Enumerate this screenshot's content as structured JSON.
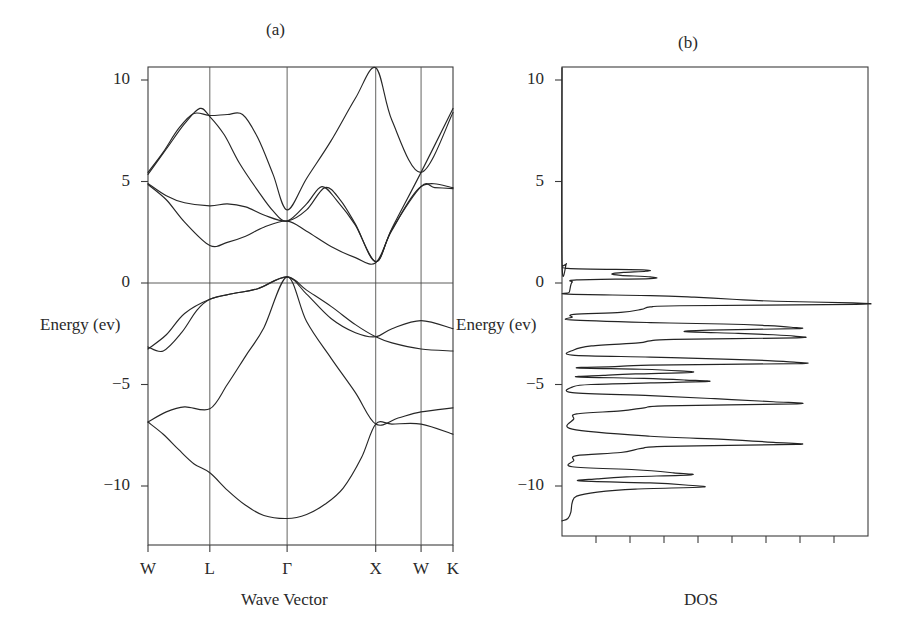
{
  "figure": {
    "panel_a": {
      "title": "(a)",
      "xlabel": "Wave Vector",
      "ylabel": "Energy (ev)"
    },
    "panel_b": {
      "title": "(b)",
      "xlabel": "DOS",
      "ylabel": "Energy (ev)"
    }
  },
  "energy_ticks": [
    {
      "label": "10",
      "value": 10
    },
    {
      "label": "5",
      "value": 5
    },
    {
      "label": "0",
      "value": 0
    },
    {
      "label": "−5",
      "value": -5
    },
    {
      "label": "−10",
      "value": -10
    }
  ],
  "k_ticks": [
    {
      "label": "W",
      "pos": 0.0
    },
    {
      "label": "L",
      "pos": 0.2027
    },
    {
      "label": "Γ",
      "pos": 0.4561
    },
    {
      "label": "X",
      "pos": 0.7466
    },
    {
      "label": "W",
      "pos": 0.8953
    },
    {
      "label": "K",
      "pos": 1.0
    }
  ],
  "chart_data": [
    {
      "type": "line",
      "title": "(a)",
      "xlabel": "Wave Vector",
      "ylabel": "Energy (ev)",
      "ylim": [
        -11.8,
        10.8
      ],
      "grid": true,
      "legend": "none",
      "x_tick_labels": [
        "W",
        "L",
        "Γ",
        "X",
        "W",
        "K"
      ],
      "x_tick_positions": [
        0.0,
        0.2027,
        0.4561,
        0.7466,
        0.8953,
        1.0
      ],
      "y_tick_labels": [
        "10",
        "5",
        "0",
        "−5",
        "−10"
      ],
      "y_tick_values": [
        10,
        5,
        0,
        -5,
        -10
      ],
      "series": [
        {
          "name": "valence-band-1",
          "comment": "lowest valence band, min at Gamma -11.6",
          "points": [
            [
              0.0,
              -6.85
            ],
            [
              0.05,
              -7.45
            ],
            [
              0.1,
              -8.2
            ],
            [
              0.15,
              -8.9
            ],
            [
              0.2027,
              -9.35
            ],
            [
              0.26,
              -10.2
            ],
            [
              0.32,
              -10.95
            ],
            [
              0.38,
              -11.45
            ],
            [
              0.4561,
              -11.6
            ],
            [
              0.52,
              -11.4
            ],
            [
              0.58,
              -10.9
            ],
            [
              0.64,
              -10.1
            ],
            [
              0.7,
              -8.6
            ],
            [
              0.7466,
              -6.95
            ],
            [
              0.8,
              -6.95
            ],
            [
              0.8953,
              -6.95
            ],
            [
              1.0,
              -7.45
            ]
          ]
        },
        {
          "name": "valence-band-2",
          "comment": "second valence band W -6.85 to L -6.2, rises to Gamma 0.3",
          "points": [
            [
              0.0,
              -6.85
            ],
            [
              0.06,
              -6.35
            ],
            [
              0.12,
              -6.1
            ],
            [
              0.2027,
              -6.2
            ],
            [
              0.26,
              -5.0
            ],
            [
              0.32,
              -3.6
            ],
            [
              0.38,
              -2.2
            ],
            [
              0.4561,
              0.3
            ],
            [
              0.52,
              -1.9
            ],
            [
              0.6,
              -3.7
            ],
            [
              0.68,
              -5.4
            ],
            [
              0.7466,
              -6.95
            ],
            [
              0.82,
              -6.65
            ],
            [
              0.8953,
              -6.35
            ],
            [
              1.0,
              -6.15
            ]
          ]
        },
        {
          "name": "valence-band-3",
          "comment": "upper valence band W -3.15 rising to Gamma 0.3, down to X -2.65",
          "points": [
            [
              0.0,
              -3.15
            ],
            [
              0.05,
              -3.35
            ],
            [
              0.11,
              -2.45
            ],
            [
              0.16,
              -1.35
            ],
            [
              0.2027,
              -0.8
            ],
            [
              0.28,
              -0.52
            ],
            [
              0.36,
              -0.28
            ],
            [
              0.4561,
              0.3
            ],
            [
              0.52,
              -0.35
            ],
            [
              0.6,
              -1.15
            ],
            [
              0.68,
              -2.05
            ],
            [
              0.7466,
              -2.65
            ],
            [
              0.8,
              -2.95
            ],
            [
              0.8953,
              -3.25
            ],
            [
              1.0,
              -3.35
            ]
          ]
        },
        {
          "name": "valence-band-4",
          "comment": "degenerate top valence band W -3.25, Gamma 0.3, X -2.65 branch",
          "points": [
            [
              0.0,
              -3.25
            ],
            [
              0.06,
              -2.55
            ],
            [
              0.12,
              -1.5
            ],
            [
              0.2027,
              -0.8
            ],
            [
              0.28,
              -0.52
            ],
            [
              0.36,
              -0.28
            ],
            [
              0.4561,
              0.3
            ],
            [
              0.52,
              -0.55
            ],
            [
              0.6,
              -1.75
            ],
            [
              0.68,
              -2.45
            ],
            [
              0.7466,
              -2.65
            ],
            [
              0.8,
              -2.25
            ],
            [
              0.8953,
              -1.85
            ],
            [
              1.0,
              -2.25
            ]
          ]
        },
        {
          "name": "conduction-band-1",
          "comment": "lowest conduction band, X minimum 1.0, Gamma 3.6",
          "points": [
            [
              0.0,
              4.85
            ],
            [
              0.06,
              4.1
            ],
            [
              0.12,
              3.0
            ],
            [
              0.2027,
              1.85
            ],
            [
              0.26,
              2.0
            ],
            [
              0.32,
              2.3
            ],
            [
              0.38,
              2.75
            ],
            [
              0.4561,
              3.05
            ],
            [
              0.52,
              2.55
            ],
            [
              0.6,
              1.8
            ],
            [
              0.68,
              1.25
            ],
            [
              0.7466,
              1.0
            ],
            [
              0.8,
              2.6
            ],
            [
              0.8953,
              4.75
            ],
            [
              1.0,
              4.7
            ]
          ]
        },
        {
          "name": "conduction-band-2",
          "comment": "second conduction band, W 4.9 to L 3.8 flat, Gamma 3.6, rises to X 10.6",
          "points": [
            [
              0.0,
              4.9
            ],
            [
              0.06,
              4.3
            ],
            [
              0.12,
              3.95
            ],
            [
              0.2027,
              3.8
            ],
            [
              0.26,
              3.9
            ],
            [
              0.32,
              3.75
            ],
            [
              0.38,
              3.35
            ],
            [
              0.4561,
              3.05
            ],
            [
              0.52,
              3.6
            ],
            [
              0.58,
              4.7
            ],
            [
              0.63,
              4.1
            ],
            [
              0.68,
              2.9
            ],
            [
              0.7466,
              1.05
            ],
            [
              0.8,
              2.65
            ],
            [
              0.8953,
              4.75
            ],
            [
              0.94,
              4.7
            ],
            [
              1.0,
              4.65
            ]
          ]
        },
        {
          "name": "conduction-band-3",
          "comment": "W 5.45 to L 8.2, dips to Gamma 3.6, peak at X 10.6",
          "points": [
            [
              0.0,
              5.45
            ],
            [
              0.05,
              6.45
            ],
            [
              0.1,
              7.6
            ],
            [
              0.15,
              8.35
            ],
            [
              0.2027,
              8.25
            ],
            [
              0.26,
              8.3
            ],
            [
              0.31,
              8.3
            ],
            [
              0.36,
              7.15
            ],
            [
              0.41,
              5.35
            ],
            [
              0.4561,
              3.6
            ],
            [
              0.52,
              5.15
            ],
            [
              0.6,
              7.0
            ],
            [
              0.68,
              9.1
            ],
            [
              0.7466,
              10.6
            ],
            [
              0.8,
              8.0
            ],
            [
              0.8953,
              5.45
            ],
            [
              1.0,
              8.4
            ]
          ]
        },
        {
          "name": "conduction-band-4",
          "comment": "W 5.35 rising to L peak 8.6 then down, Gamma 4.85 branch",
          "points": [
            [
              0.0,
              5.35
            ],
            [
              0.06,
              6.6
            ],
            [
              0.12,
              7.85
            ],
            [
              0.17,
              8.6
            ],
            [
              0.2027,
              8.2
            ],
            [
              0.25,
              7.3
            ],
            [
              0.3,
              5.9
            ],
            [
              0.36,
              4.55
            ],
            [
              0.41,
              3.55
            ],
            [
              0.4561,
              3.05
            ],
            [
              0.52,
              3.9
            ],
            [
              0.57,
              4.75
            ],
            [
              0.62,
              4.05
            ],
            [
              0.68,
              2.85
            ],
            [
              0.7466,
              1.05
            ],
            [
              0.8,
              2.7
            ],
            [
              0.8953,
              5.45
            ],
            [
              1.0,
              8.6
            ]
          ]
        }
      ]
    },
    {
      "type": "line",
      "title": "(b)",
      "xlabel": "DOS",
      "ylabel": "Energy (ev)",
      "ylim": [
        -11.8,
        10.8
      ],
      "xlim": [
        0,
        1
      ],
      "grid": false,
      "legend": "none",
      "orientation": "horizontal",
      "n_x_ticks": 8,
      "y_tick_labels": [
        "10",
        "5",
        "0",
        "−5",
        "−10"
      ],
      "y_tick_values": [
        10,
        5,
        0,
        -5,
        -10
      ],
      "comment": "Density of states plotted with energy on vertical axis; value is normalized DOS intensity 0..1 at each energy.",
      "dos": [
        [
          10.6,
          0.0
        ],
        [
          1.05,
          0.0
        ],
        [
          0.95,
          0.015
        ],
        [
          0.72,
          0.02
        ],
        [
          0.65,
          0.275
        ],
        [
          0.58,
          0.285
        ],
        [
          0.52,
          0.21
        ],
        [
          0.45,
          0.17
        ],
        [
          0.38,
          0.2
        ],
        [
          0.3,
          0.3
        ],
        [
          0.22,
          0.3
        ],
        [
          0.15,
          0.05
        ],
        [
          0.05,
          0.035
        ],
        [
          -0.1,
          0.03
        ],
        [
          -0.45,
          0.025
        ],
        [
          -0.55,
          0.02
        ],
        [
          -0.62,
          0.3
        ],
        [
          -0.7,
          0.45
        ],
        [
          -0.8,
          0.58
        ],
        [
          -0.9,
          0.73
        ],
        [
          -0.98,
          0.99
        ],
        [
          -1.05,
          1.0
        ],
        [
          -1.12,
          0.4
        ],
        [
          -1.18,
          0.3
        ],
        [
          -1.3,
          0.27
        ],
        [
          -1.45,
          0.2
        ],
        [
          -1.55,
          0.04
        ],
        [
          -1.68,
          0.035
        ],
        [
          -1.82,
          0.03
        ],
        [
          -1.95,
          0.3
        ],
        [
          -2.02,
          0.55
        ],
        [
          -2.1,
          0.7
        ],
        [
          -2.18,
          0.78
        ],
        [
          -2.25,
          0.8
        ],
        [
          -2.32,
          0.5
        ],
        [
          -2.4,
          0.42
        ],
        [
          -2.48,
          0.6
        ],
        [
          -2.55,
          0.72
        ],
        [
          -2.62,
          0.79
        ],
        [
          -2.7,
          0.8
        ],
        [
          -2.78,
          0.38
        ],
        [
          -2.85,
          0.3
        ],
        [
          -2.95,
          0.26
        ],
        [
          -3.1,
          0.1
        ],
        [
          -3.3,
          0.04
        ],
        [
          -3.55,
          0.035
        ],
        [
          -3.65,
          0.3
        ],
        [
          -3.75,
          0.55
        ],
        [
          -3.82,
          0.7
        ],
        [
          -3.9,
          0.79
        ],
        [
          -3.97,
          0.8
        ],
        [
          -4.05,
          0.3
        ],
        [
          -4.12,
          0.18
        ],
        [
          -4.18,
          0.05
        ],
        [
          -4.25,
          0.27
        ],
        [
          -4.33,
          0.4
        ],
        [
          -4.4,
          0.44
        ],
        [
          -4.48,
          0.25
        ],
        [
          -4.55,
          0.14
        ],
        [
          -4.62,
          0.05
        ],
        [
          -4.7,
          0.28
        ],
        [
          -4.78,
          0.42
        ],
        [
          -4.85,
          0.5
        ],
        [
          -4.92,
          0.3
        ],
        [
          -5.0,
          0.1
        ],
        [
          -5.1,
          0.04
        ],
        [
          -5.4,
          0.035
        ],
        [
          -5.55,
          0.3
        ],
        [
          -5.7,
          0.52
        ],
        [
          -5.85,
          0.72
        ],
        [
          -5.95,
          0.8
        ],
        [
          -6.05,
          0.35
        ],
        [
          -6.15,
          0.28
        ],
        [
          -6.3,
          0.2
        ],
        [
          -6.45,
          0.05
        ],
        [
          -6.7,
          0.04
        ],
        [
          -7.2,
          0.035
        ],
        [
          -7.55,
          0.3
        ],
        [
          -7.7,
          0.55
        ],
        [
          -7.85,
          0.72
        ],
        [
          -7.95,
          0.8
        ],
        [
          -8.05,
          0.35
        ],
        [
          -8.15,
          0.27
        ],
        [
          -8.35,
          0.2
        ],
        [
          -8.5,
          0.05
        ],
        [
          -8.75,
          0.04
        ],
        [
          -9.05,
          0.035
        ],
        [
          -9.2,
          0.25
        ],
        [
          -9.35,
          0.38
        ],
        [
          -9.45,
          0.44
        ],
        [
          -9.55,
          0.22
        ],
        [
          -9.65,
          0.12
        ],
        [
          -9.75,
          0.06
        ],
        [
          -9.85,
          0.3
        ],
        [
          -9.95,
          0.42
        ],
        [
          -10.05,
          0.48
        ],
        [
          -10.15,
          0.25
        ],
        [
          -10.3,
          0.12
        ],
        [
          -10.5,
          0.05
        ],
        [
          -10.8,
          0.035
        ],
        [
          -11.3,
          0.03
        ],
        [
          -11.6,
          0.02
        ],
        [
          -11.72,
          0.0
        ]
      ]
    }
  ]
}
